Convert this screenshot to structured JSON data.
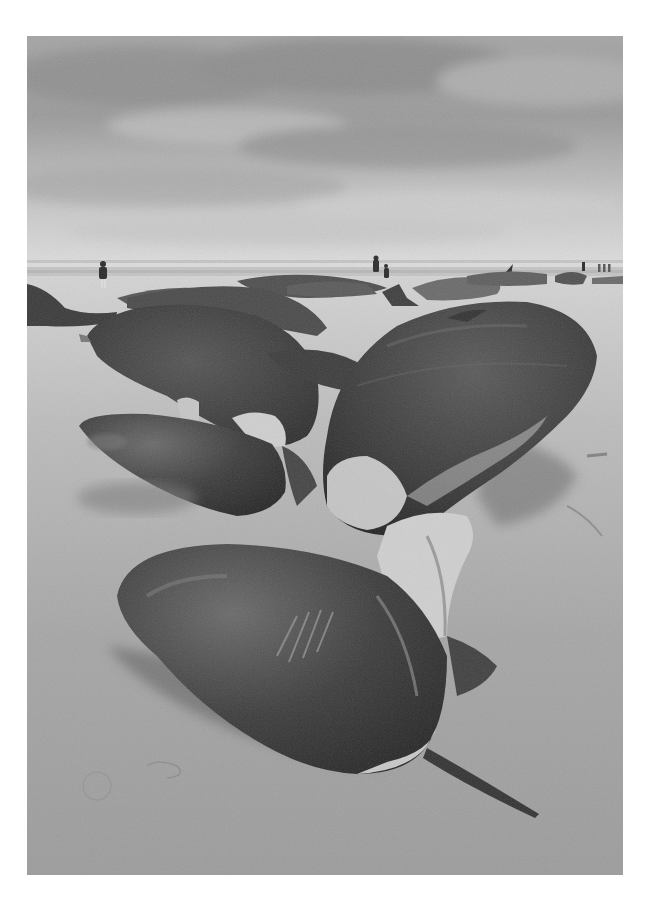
{
  "photo": {
    "description": "Black-and-white photograph of stranded sperm whales lying on a sandy beach under a cloudy sky, with a few people walking along the shoreline in the distance",
    "style": "monochrome",
    "subjects": [
      "sperm-whale-tail-fluke-foreground",
      "sperm-whale-right",
      "sperm-whale-left",
      "distant-stranded-whales",
      "people-on-shore"
    ],
    "colors": {
      "border": "#ffffff",
      "sky_light": "#d6d6d6",
      "sky_dark": "#8a8a8a",
      "sea": "#c8c8c8",
      "sand": "#a8a8a8",
      "whale_dark": "#2e2e2e",
      "whale_mid": "#4a4a4a"
    }
  }
}
